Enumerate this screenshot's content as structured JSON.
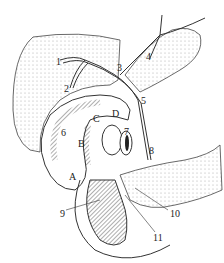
{
  "figure": {
    "type": "anatomical line drawing",
    "labels": [
      {
        "id": "1",
        "text": "1",
        "x": 56,
        "y": 57
      },
      {
        "id": "2",
        "text": "2",
        "x": 64,
        "y": 84
      },
      {
        "id": "3",
        "text": "3",
        "x": 117,
        "y": 63
      },
      {
        "id": "4",
        "text": "4",
        "x": 146,
        "y": 52
      },
      {
        "id": "5",
        "text": "5",
        "x": 141,
        "y": 96
      },
      {
        "id": "6",
        "text": "6",
        "x": 61,
        "y": 128
      },
      {
        "id": "7",
        "text": "7",
        "x": 124,
        "y": 127
      },
      {
        "id": "8",
        "text": "8",
        "x": 149,
        "y": 146
      },
      {
        "id": "9",
        "text": "9",
        "x": 60,
        "y": 209
      },
      {
        "id": "10",
        "text": "10",
        "x": 170,
        "y": 209
      },
      {
        "id": "11",
        "text": "11",
        "x": 153,
        "y": 233
      },
      {
        "id": "A",
        "text": "A",
        "x": 69,
        "y": 172
      },
      {
        "id": "B",
        "text": "B",
        "x": 78,
        "y": 139
      },
      {
        "id": "C",
        "text": "C",
        "x": 93,
        "y": 114
      },
      {
        "id": "D",
        "text": "D",
        "x": 112,
        "y": 109
      }
    ]
  }
}
